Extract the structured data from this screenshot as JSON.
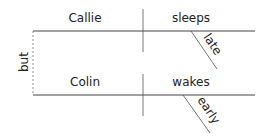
{
  "diagram": {
    "type": "sentence-diagram",
    "conjunction": "but",
    "clauses": [
      {
        "subject": "Callie",
        "verb": "sleeps",
        "modifier": "late"
      },
      {
        "subject": "Colin",
        "verb": "wakes",
        "modifier": "early"
      }
    ]
  }
}
